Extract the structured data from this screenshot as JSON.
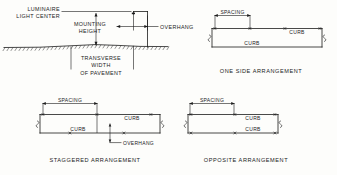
{
  "figure": {
    "ink_color": "#1b1b1b",
    "background_color": "#fdfdfb"
  },
  "panels": {
    "cross_section": {
      "name": "cross-section",
      "labels": {
        "luminaire_light_center_line1": "LUMINAIRE",
        "luminaire_light_center_line2": "LIGHT CENTER",
        "mounting_height_line1": "MOUNTING",
        "mounting_height_line2": "HEIGHT",
        "overhang": "OVERHANG",
        "transverse_width_line1": "TRANSVERSE",
        "transverse_width_line2": "WIDTH",
        "transverse_width_line3": "OF PAVEMENT"
      }
    },
    "one_side": {
      "name": "one-side-arrangement",
      "caption": "ONE SIDE ARRANGEMENT",
      "spacing_label": "SPACING",
      "curb_top_label": "CURB",
      "curb_bottom_label": "CURB",
      "luminaire_marks_top": 3,
      "luminaire_marks_bottom": 0
    },
    "staggered": {
      "name": "staggered-arrangement",
      "caption": "STAGGERED ARRANGEMENT",
      "spacing_label": "SPACING",
      "curb_top_label": "CURB",
      "curb_bottom_label": "CURB",
      "overhang_label": "OVERHANG",
      "luminaire_marks_top": 2,
      "luminaire_marks_bottom": 1
    },
    "opposite": {
      "name": "opposite-arrangement",
      "caption": "OPPOSITE ARRANGEMENT",
      "spacing_label": "SPACING",
      "curb_top_label": "CURB",
      "curb_bottom_label": "CURB",
      "luminaire_marks_top": 3,
      "luminaire_marks_bottom": 3
    }
  }
}
